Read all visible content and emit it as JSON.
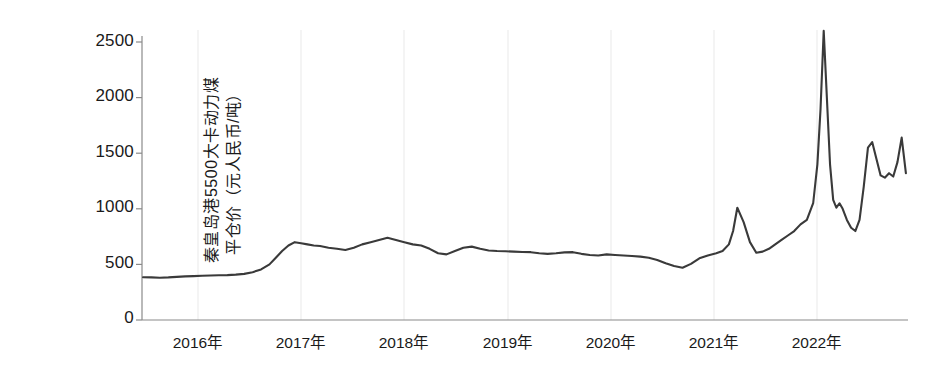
{
  "chart_data": {
    "type": "line",
    "title": "",
    "xlabel": "",
    "ylabel": "秦皇岛港5500大卡动力煤平仓价（元人民币/吨）",
    "ylabel_lines": [
      "秦皇岛港5500大卡动力煤",
      "平仓价（元人民币/吨）"
    ],
    "series_name": "秦皇岛港5500大卡动力煤平仓价",
    "line_color": "#3a3a3a",
    "grid": "vertical-only-faint",
    "legend": "none",
    "ylim": [
      0,
      2500
    ],
    "yticks": [
      0,
      500,
      1000,
      1500,
      2000,
      2500
    ],
    "ytick_labels": [
      "0",
      "500",
      "1000",
      "1500",
      "2000",
      "2500"
    ],
    "xlim": [
      2015.35,
      2022.62
    ],
    "xticks": [
      2016,
      2017,
      2018,
      2019,
      2020,
      2021,
      2022
    ],
    "xtick_labels": [
      "2016年",
      "2017年",
      "2018年",
      "2019年",
      "2020年",
      "2021年",
      "2022年"
    ],
    "unit": "元人民币/吨",
    "x": [
      2015.36,
      2015.44,
      2015.52,
      2015.6,
      2015.68,
      2015.76,
      2015.84,
      2015.92,
      2016.0,
      2016.08,
      2016.16,
      2016.24,
      2016.32,
      2016.4,
      2016.48,
      2016.56,
      2016.62,
      2016.68,
      2016.74,
      2016.8,
      2016.86,
      2016.92,
      2016.98,
      2017.04,
      2017.12,
      2017.2,
      2017.28,
      2017.36,
      2017.44,
      2017.52,
      2017.6,
      2017.68,
      2017.76,
      2017.84,
      2017.92,
      2018.0,
      2018.08,
      2018.16,
      2018.24,
      2018.32,
      2018.4,
      2018.48,
      2018.56,
      2018.64,
      2018.72,
      2018.8,
      2018.88,
      2018.96,
      2019.04,
      2019.12,
      2019.2,
      2019.28,
      2019.36,
      2019.44,
      2019.52,
      2019.6,
      2019.68,
      2019.76,
      2019.84,
      2019.92,
      2020.0,
      2020.08,
      2020.16,
      2020.24,
      2020.32,
      2020.4,
      2020.48,
      2020.56,
      2020.64,
      2020.72,
      2020.8,
      2020.86,
      2020.92,
      2020.96,
      2021.0,
      2021.06,
      2021.12,
      2021.18,
      2021.24,
      2021.3,
      2021.36,
      2021.42,
      2021.48,
      2021.54,
      2021.6,
      2021.66,
      2021.72,
      2021.76,
      2021.79,
      2021.82,
      2021.85,
      2021.88,
      2021.91,
      2021.94,
      2021.97,
      2022.0,
      2022.04,
      2022.08,
      2022.12,
      2022.16,
      2022.2,
      2022.24,
      2022.28,
      2022.32,
      2022.36,
      2022.4,
      2022.44,
      2022.48,
      2022.52,
      2022.56,
      2022.6
    ],
    "values": [
      385,
      383,
      380,
      383,
      388,
      392,
      395,
      398,
      400,
      402,
      404,
      408,
      415,
      430,
      455,
      500,
      560,
      620,
      670,
      700,
      690,
      680,
      670,
      665,
      650,
      640,
      630,
      650,
      680,
      700,
      720,
      740,
      720,
      700,
      680,
      670,
      640,
      600,
      590,
      620,
      650,
      660,
      640,
      625,
      620,
      618,
      615,
      612,
      610,
      600,
      595,
      600,
      608,
      610,
      595,
      585,
      580,
      590,
      585,
      580,
      575,
      570,
      560,
      540,
      510,
      485,
      470,
      505,
      555,
      580,
      600,
      620,
      680,
      800,
      1010,
      880,
      700,
      605,
      615,
      640,
      680,
      720,
      760,
      800,
      860,
      900,
      1050,
      1400,
      1900,
      2600,
      2000,
      1400,
      1080,
      1010,
      1050,
      1000,
      900,
      830,
      800,
      900,
      1200,
      1550,
      1600,
      1450,
      1300,
      1280,
      1320,
      1290,
      1420,
      1640,
      1320
    ]
  },
  "axes": {
    "y_axis_name": "price-axis",
    "x_axis_name": "year-axis"
  }
}
